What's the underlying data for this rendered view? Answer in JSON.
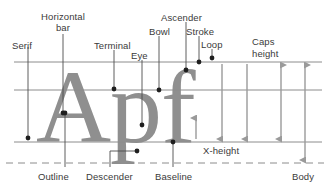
{
  "diagram": {
    "sample_text": "Apf",
    "glyph_color": "#8f8f8f",
    "line_color": "#8c8c8c",
    "leader_color": "#4d4d4d",
    "arrow_color": "#9a9a9a",
    "text_color": "#3a3a3a",
    "background": "#ffffff",
    "guides": [
      {
        "name": "cap-height-line",
        "label": "",
        "y": 62,
        "style": "solid"
      },
      {
        "name": "x-height-line",
        "label": "",
        "y": 90,
        "style": "solid"
      },
      {
        "name": "baseline-line",
        "label": "Baseline",
        "y": 142,
        "style": "solid"
      },
      {
        "name": "body-line",
        "label": "Body",
        "y": 163,
        "style": "dashed"
      }
    ],
    "labels": [
      {
        "id": "serif",
        "text": "Serif",
        "x": 12,
        "y": 40,
        "align": "left"
      },
      {
        "id": "horizontal-bar",
        "text": "Horizontal",
        "x": 72,
        "y": 11,
        "align": "center",
        "width": 76
      },
      {
        "id": "horizontal-bar-2",
        "text": "bar",
        "x": 72,
        "y": 22,
        "align": "center",
        "width": 76
      },
      {
        "id": "terminal",
        "text": "Terminal",
        "x": 94,
        "y": 40,
        "align": "left"
      },
      {
        "id": "eye",
        "text": "Eye",
        "x": 131,
        "y": 50,
        "align": "left"
      },
      {
        "id": "bowl",
        "text": "Bowl",
        "x": 156,
        "y": 26,
        "align": "left"
      },
      {
        "id": "ascender",
        "text": "Ascender",
        "x": 161,
        "y": 12,
        "align": "left"
      },
      {
        "id": "stroke",
        "text": "Stroke",
        "x": 188,
        "y": 26,
        "align": "left"
      },
      {
        "id": "loop",
        "text": "Loop",
        "x": 198,
        "y": 39,
        "align": "left"
      },
      {
        "id": "caps-height",
        "text": "Caps",
        "x": 252,
        "y": 36,
        "align": "left"
      },
      {
        "id": "caps-height-2",
        "text": "height",
        "x": 252,
        "y": 48,
        "align": "left"
      },
      {
        "id": "x-height",
        "text": "X-height",
        "x": 203,
        "y": 145,
        "align": "left"
      },
      {
        "id": "outline",
        "text": "Outline",
        "x": 38,
        "y": 172,
        "align": "left"
      },
      {
        "id": "descender",
        "text": "Descender",
        "x": 86,
        "y": 172,
        "align": "left"
      },
      {
        "id": "baseline",
        "text": "Baseline",
        "x": 155,
        "y": 172,
        "align": "left"
      },
      {
        "id": "body",
        "text": "Body",
        "x": 292,
        "y": 172,
        "align": "left"
      }
    ],
    "measure_arrows": [
      {
        "name": "caps-height-arrow",
        "from_y": 62,
        "to_y": 142,
        "x": 281,
        "double": true
      },
      {
        "name": "body-arrow",
        "from_y": 62,
        "to_y": 163,
        "x": 305,
        "double": true
      },
      {
        "name": "x-height-arrow-left",
        "from_y": 90,
        "to_y": 142,
        "x": 222,
        "double": false
      },
      {
        "name": "x-height-arrow-right",
        "from_y": 90,
        "to_y": 142,
        "x": 247,
        "double": false
      },
      {
        "name": "x-height-arrow-small",
        "from_y": 142,
        "to_y": 118,
        "x": 196,
        "double": false
      }
    ],
    "leaders": [
      {
        "id": "serif-leader",
        "dot_x": 28,
        "dot_y": 138,
        "path": "M28,47 L28,138"
      },
      {
        "id": "horizontal-bar-leader",
        "dot_x": 63,
        "dot_y": 113,
        "path": "M63,34 L63,113"
      },
      {
        "id": "terminal-leader",
        "dot_x": 114,
        "dot_y": 89,
        "path": "M114,50 L114,89"
      },
      {
        "id": "eye-leader",
        "dot_x": 142,
        "dot_y": 125,
        "path": "M142,60 L142,125"
      },
      {
        "id": "bowl-leader",
        "dot_x": 159,
        "dot_y": 90,
        "path": "M159,36 L159,90"
      },
      {
        "id": "ascender-leader",
        "dot_x": 186,
        "dot_y": 70,
        "path": "M186,22 L186,70"
      },
      {
        "id": "stroke-leader",
        "dot_x": 199,
        "dot_y": 62,
        "path": "M199,36 L199,62"
      },
      {
        "id": "loop-leader",
        "dot_x": 212,
        "dot_y": 58,
        "path": "M212,49 L212,58"
      },
      {
        "id": "outline-leader",
        "dot_x": 65,
        "dot_y": 113,
        "path": "M65,167 L65,113"
      },
      {
        "id": "descender-leader",
        "dot_x": 137,
        "dot_y": 151,
        "path": "M110,167 L110,151 L137,151"
      },
      {
        "id": "baseline-leader",
        "dot_x": 173,
        "dot_y": 142,
        "path": "M173,167 L173,142"
      }
    ]
  }
}
